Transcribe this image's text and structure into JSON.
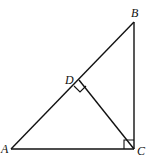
{
  "figure": {
    "type": "right triangle with altitude",
    "labels": {
      "A": "A",
      "B": "B",
      "C": "C",
      "D": "D"
    },
    "right_angles": [
      "C",
      "D"
    ],
    "segments": [
      "AB",
      "BC",
      "CA",
      "CD"
    ]
  }
}
